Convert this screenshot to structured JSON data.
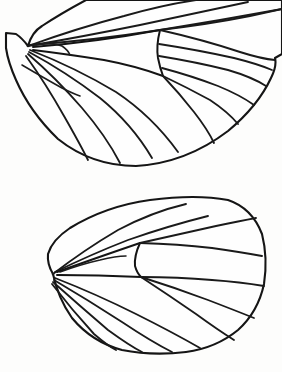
{
  "figure": {
    "kind": "line-drawing",
    "caption": "",
    "width_px": 282,
    "height_px": 372,
    "background_color": "#fdfdfc",
    "ink_color": "#1a1a1a",
    "has_labels": false,
    "has_scale_bar": false,
    "panel_count": 2
  },
  "panels": [
    {
      "id": "forewing",
      "name": "forewing",
      "position": "upper",
      "cropped_at_edges": [
        "top",
        "right"
      ],
      "closed_outline": false,
      "bounds": {
        "x": 5,
        "y": 0,
        "width": 277,
        "height": 170
      },
      "base_node": {
        "x": 28,
        "y": 46
      },
      "apex": {
        "x": 275,
        "y": 62
      },
      "vein_count": 13,
      "discal_cell": {
        "present": true,
        "end_x": 160,
        "upper_y": 30,
        "lower_y": 76,
        "crossvein_label": "discocellular"
      }
    },
    {
      "id": "hindwing",
      "name": "hindwing",
      "position": "lower",
      "cropped_at_edges": [],
      "closed_outline": true,
      "bounds": {
        "x": 45,
        "y": 196,
        "width": 222,
        "height": 158
      },
      "base_node": {
        "x": 53,
        "y": 274
      },
      "apex": {
        "x": 266,
        "y": 272
      },
      "vein_count": 12,
      "discal_cell": {
        "present": true,
        "end_x": 140,
        "upper_y": 243,
        "lower_y": 277,
        "crossvein_label": "discocellular"
      }
    }
  ],
  "colors": {
    "ink": "#1a1a1a",
    "outline": "#151515",
    "paper": "#fdfdfc",
    "wing_membrane": "#fefefe"
  }
}
